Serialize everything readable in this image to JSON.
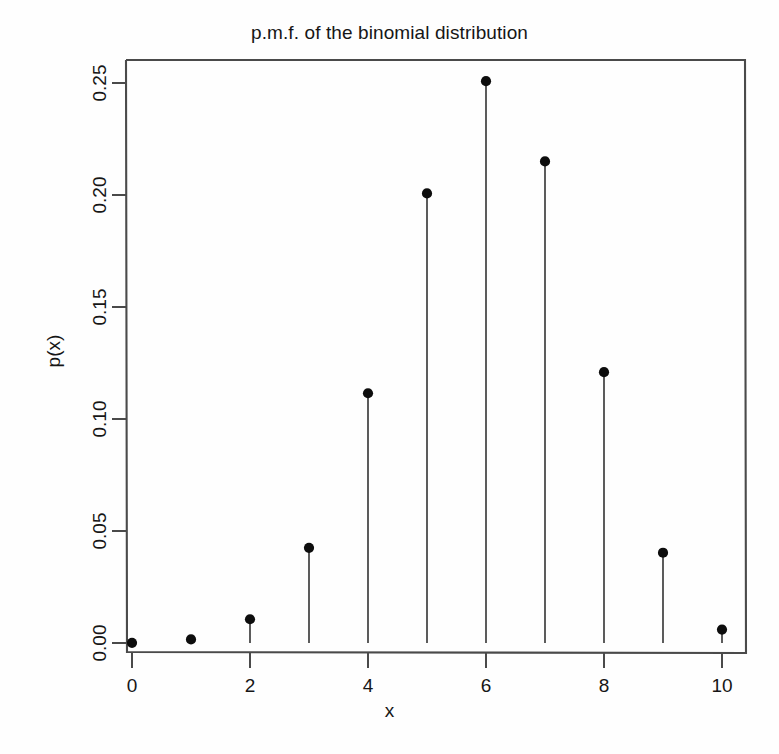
{
  "chart_data": {
    "type": "scatter",
    "title": "p.m.f. of the binomial distribution",
    "xlabel": "x",
    "ylabel": "p(x)",
    "style": "stem-plot with filled circle markers and vertical drop lines to y=0",
    "categories": [
      0,
      1,
      2,
      3,
      4,
      5,
      6,
      7,
      8,
      9,
      10
    ],
    "x": [
      0,
      1,
      2,
      3,
      4,
      5,
      6,
      7,
      8,
      9,
      10
    ],
    "values": [
      0.0001,
      0.0016,
      0.0106,
      0.0425,
      0.1115,
      0.2007,
      0.2508,
      0.215,
      0.1209,
      0.0403,
      0.006
    ],
    "series": [
      {
        "name": "p(x)",
        "values": [
          0.0001,
          0.0016,
          0.0106,
          0.0425,
          0.1115,
          0.2007,
          0.2508,
          0.215,
          0.1209,
          0.0403,
          0.006
        ]
      }
    ],
    "xlim": [
      -0.45,
      10.45
    ],
    "ylim": [
      0.0,
      0.2635
    ],
    "xticks": [
      0,
      2,
      4,
      6,
      8,
      10
    ],
    "xtick_labels": [
      "0",
      "2",
      "4",
      "6",
      "8",
      "10"
    ],
    "yticks": [
      0.0,
      0.05,
      0.1,
      0.15,
      0.2,
      0.25
    ],
    "ytick_labels": [
      "0.00",
      "0.05",
      "0.10",
      "0.15",
      "0.20",
      "0.25"
    ],
    "grid": false,
    "legend": null,
    "legend_position": "none",
    "annotations": [],
    "colors": {
      "background": "#fefefe",
      "axis": "#444444",
      "marker": "#0d0d0d",
      "stem": "#333333",
      "text": "#161616"
    }
  },
  "axes": {
    "y_tick_labels_rotated": true
  }
}
